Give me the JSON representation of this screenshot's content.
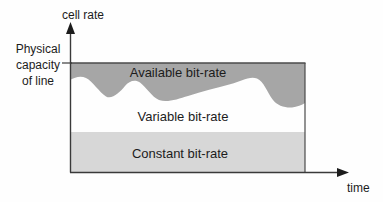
{
  "diagram": {
    "y_axis_label": "cell rate",
    "x_axis_label": "time",
    "capacity_label": "Physical\ncapacity\nof line",
    "regions": [
      {
        "label": "Available bit-rate",
        "color": "#a6a6a6"
      },
      {
        "label": "Variable bit-rate",
        "color": "#ffffff"
      },
      {
        "label": "Constant bit-rate",
        "color": "#d7d7d7"
      }
    ],
    "colors": {
      "axis": "#3a3a3a",
      "box_border": "#4a4a4a",
      "background": "#fefefe",
      "text": "#1c1c1c"
    }
  }
}
